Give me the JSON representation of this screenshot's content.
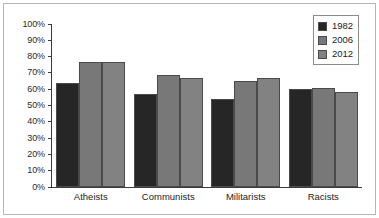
{
  "chart_data": {
    "type": "bar",
    "title": "",
    "subtitle": "",
    "xlabel": "",
    "ylabel": "",
    "ylim": [
      0,
      100
    ],
    "y_tick_labels": [
      "100%",
      "90%",
      "80%",
      "70%",
      "60%",
      "50%",
      "40%",
      "30%",
      "20%",
      "10%",
      "0%"
    ],
    "y_tick_values": [
      100,
      90,
      80,
      70,
      60,
      50,
      40,
      30,
      20,
      10,
      0
    ],
    "grid": false,
    "legend_position": "top-right",
    "categories": [
      "Atheists",
      "Communists",
      "Militarists",
      "Racists"
    ],
    "series": [
      {
        "name": "1982",
        "color": "#262626",
        "values": [
          64,
          57,
          54,
          60
        ]
      },
      {
        "name": "2006",
        "color": "#787878",
        "values": [
          77,
          69,
          65,
          61
        ]
      },
      {
        "name": "2012",
        "color": "#828282",
        "values": [
          77,
          67,
          67,
          58
        ]
      }
    ]
  },
  "legend": {
    "items": [
      {
        "label": "1982",
        "color": "#262626"
      },
      {
        "label": "2006",
        "color": "#787878"
      },
      {
        "label": "2012",
        "color": "#828282"
      }
    ]
  },
  "colors": {
    "frame_border": "#b7b7b7",
    "axis": "#3c3c3c",
    "bar_outline": "#4a4a4a",
    "background": "#ffffff",
    "text": "#1c1c1c"
  }
}
